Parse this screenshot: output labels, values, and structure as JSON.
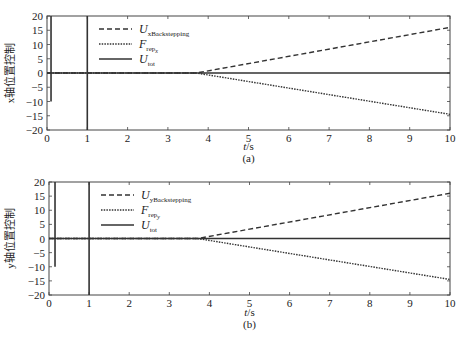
{
  "chart_data": [
    {
      "type": "line",
      "panel": "(a)",
      "xlabel": "t/s",
      "ylabel": "x轴位置控制",
      "xlim": [
        0,
        10
      ],
      "ylim": [
        -20,
        20
      ],
      "xticks": [
        0,
        1,
        2,
        3,
        4,
        5,
        6,
        7,
        8,
        9,
        10
      ],
      "yticks": [
        20,
        15,
        10,
        5,
        0,
        -5,
        -10,
        -15,
        -20
      ],
      "legend": [
        "U_xBackstepping",
        "F_rep_x",
        "U_tot"
      ],
      "legend_position": "upper left",
      "series": [
        {
          "name": "U_xBackstepping",
          "style": "dashed",
          "x": [
            0,
            3.7,
            10
          ],
          "y": [
            0,
            0,
            16
          ]
        },
        {
          "name": "F_rep_x",
          "style": "dotted",
          "x": [
            0,
            3.7,
            10
          ],
          "y": [
            0,
            0,
            -14.5
          ]
        },
        {
          "name": "U_tot",
          "style": "solid",
          "x": [
            0,
            0.1,
            0.1,
            0.1,
            1,
            1,
            1,
            10
          ],
          "y": [
            0,
            0,
            20,
            -10,
            0,
            20,
            -20,
            0
          ]
        }
      ]
    },
    {
      "type": "line",
      "panel": "(b)",
      "xlabel": "t/s",
      "ylabel": "y轴位置控制",
      "xlim": [
        0,
        10
      ],
      "ylim": [
        -20,
        20
      ],
      "xticks": [
        0,
        1,
        2,
        3,
        4,
        5,
        6,
        7,
        8,
        9,
        10
      ],
      "yticks": [
        20,
        15,
        10,
        5,
        0,
        -5,
        -10,
        -15,
        -20
      ],
      "legend": [
        "U_yBackstepping",
        "F_rep_y",
        "U_tot"
      ],
      "legend_position": "upper left",
      "series": [
        {
          "name": "U_yBackstepping",
          "style": "dashed",
          "x": [
            0,
            3.7,
            10
          ],
          "y": [
            0,
            0,
            16
          ]
        },
        {
          "name": "F_rep_y",
          "style": "dotted",
          "x": [
            0,
            3.7,
            10
          ],
          "y": [
            0,
            0,
            -14.5
          ]
        },
        {
          "name": "U_tot",
          "style": "solid",
          "x": [
            0,
            0.15,
            0.15,
            0.15,
            1,
            1,
            1,
            10
          ],
          "y": [
            0,
            0,
            20,
            -10,
            0,
            20,
            -20,
            0
          ]
        }
      ]
    }
  ],
  "panels": {
    "a": {
      "caption": "(a)",
      "xlabel": "t/s",
      "ylabel": "x轴位置控制",
      "legend": {
        "l1_main": "U",
        "l1_sub": "xBackstepping",
        "l2_main": "F",
        "l2_sub": "rep",
        "l2_subsub": "x",
        "l3_main": "U",
        "l3_sub": "tot"
      }
    },
    "b": {
      "caption": "(b)",
      "xlabel": "t/s",
      "ylabel": "y轴位置控制",
      "legend": {
        "l1_main": "U",
        "l1_sub": "yBackstepping",
        "l2_main": "F",
        "l2_sub": "rep",
        "l2_subsub": "y",
        "l3_main": "U",
        "l3_sub": "tot"
      }
    }
  }
}
